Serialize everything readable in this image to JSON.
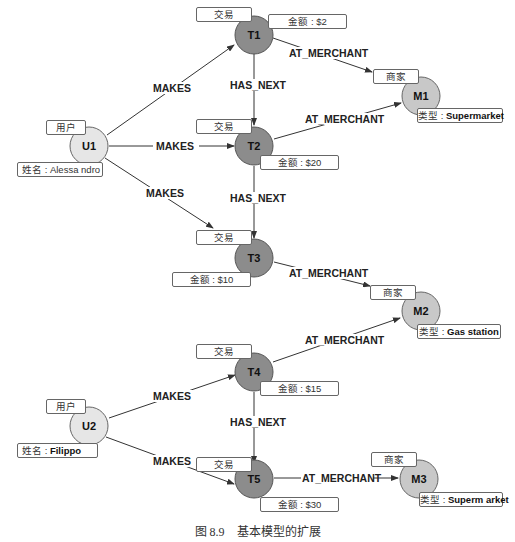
{
  "nodes": {
    "U1": {
      "id": "U1",
      "type_label": "用户",
      "prop_key": "姓名",
      "prop_value": "Alessa ndro"
    },
    "U2": {
      "id": "U2",
      "type_label": "用户",
      "prop_key": "姓名",
      "prop_value": "Filippo"
    },
    "T1": {
      "id": "T1",
      "type_label": "交易",
      "prop_key": "金额",
      "prop_value": "$2"
    },
    "T2": {
      "id": "T2",
      "type_label": "交易",
      "prop_key": "金额",
      "prop_value": "$20"
    },
    "T3": {
      "id": "T3",
      "type_label": "交易",
      "prop_key": "金额",
      "prop_value": "$10"
    },
    "T4": {
      "id": "T4",
      "type_label": "交易",
      "prop_key": "金额",
      "prop_value": "$15"
    },
    "T5": {
      "id": "T5",
      "type_label": "交易",
      "prop_key": "金额",
      "prop_value": "$30"
    },
    "M1": {
      "id": "M1",
      "type_label": "商家",
      "prop_key": "类型",
      "prop_value": "Supermarket"
    },
    "M2": {
      "id": "M2",
      "type_label": "商家",
      "prop_key": "类型",
      "prop_value": "Gas station"
    },
    "M3": {
      "id": "M3",
      "type_label": "商家",
      "prop_key": "类型",
      "prop_value": "Superm arket"
    }
  },
  "edges": {
    "makes": "MAKES",
    "has_next": "HAS_NEXT",
    "at_merchant": "AT_MERCHANT"
  },
  "caption": "图 8.9　基本模型的扩展"
}
